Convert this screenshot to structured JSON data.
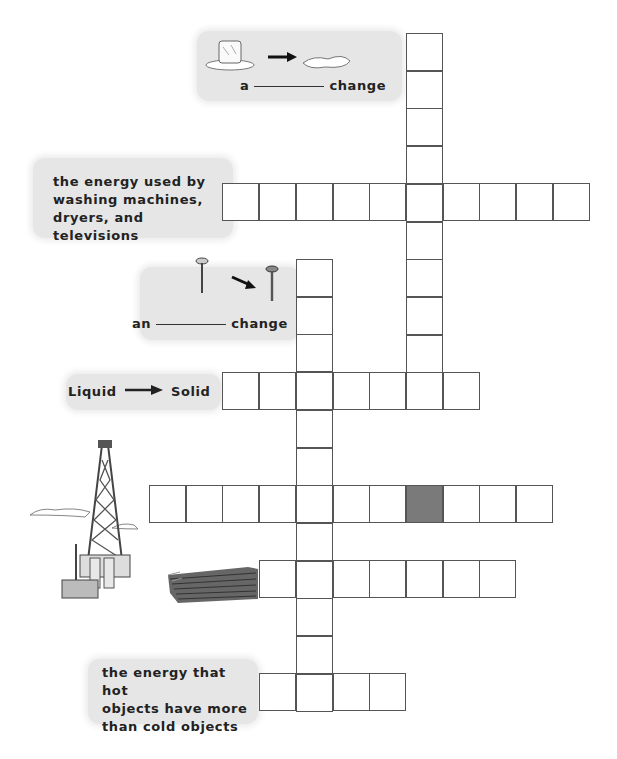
{
  "clues": {
    "melting": {
      "prefix": "a",
      "suffix": "change",
      "icon": "ice-melting-icon"
    },
    "electrical": {
      "lines": [
        "the energy used by",
        "washing machines,",
        "dryers, and televisions"
      ]
    },
    "chemical": {
      "prefix": "an",
      "suffix": "change",
      "icon": "screw-rusting-icon"
    },
    "freezing": {
      "from": "Liquid",
      "to": "Solid",
      "icon": "arrow-right-icon"
    },
    "oil": {
      "icon": "oil-derrick-icon"
    },
    "lumber": {
      "icon": "lumber-stack-icon"
    },
    "thermal": {
      "lines": [
        "the energy that hot",
        "objects have more",
        "than cold objects"
      ]
    }
  },
  "grid": {
    "cell_size": 36.7,
    "shaded_color": "#7a7a7a",
    "border_color": "#555555",
    "label_bg": "#e6e6e6"
  }
}
